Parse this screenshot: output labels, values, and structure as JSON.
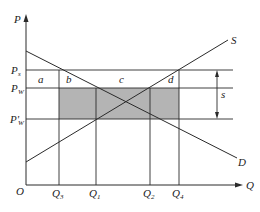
{
  "diagram": {
    "type": "supply-demand-subsidy",
    "axes": {
      "y_label": "P",
      "x_label": "Q",
      "origin_label": "O"
    },
    "curves": {
      "supply": {
        "label": "S"
      },
      "demand": {
        "label": "D"
      }
    },
    "price_levels": [
      {
        "id": "ps",
        "label": "P",
        "sub": "s"
      },
      {
        "id": "pw",
        "label": "P",
        "sub": "W"
      },
      {
        "id": "pw_prime",
        "label": "P'",
        "sub": "W"
      }
    ],
    "quantity_levels": [
      {
        "id": "q3",
        "label": "Q",
        "sub": "3"
      },
      {
        "id": "q1",
        "label": "Q",
        "sub": "1"
      },
      {
        "id": "q2",
        "label": "Q",
        "sub": "2"
      },
      {
        "id": "q4",
        "label": "Q",
        "sub": "4"
      }
    ],
    "area_labels": {
      "a": "a",
      "b": "b",
      "c": "c",
      "d": "d"
    },
    "subsidy_label": "s",
    "colors": {
      "line": "#2a2a2a",
      "shaded_area": "#b4b4b4"
    }
  }
}
